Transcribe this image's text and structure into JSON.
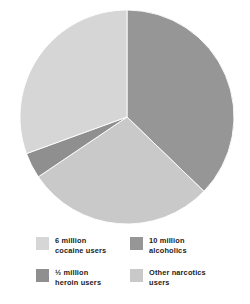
{
  "chart_data": {
    "type": "pie",
    "title": "",
    "subtitle": "",
    "xlabel": "",
    "ylabel": "",
    "grid": false,
    "legend_position": "bottom",
    "units": "millions of users",
    "start_angle_deg": 0,
    "direction": "clockwise",
    "categories": [
      "10 million alcoholics",
      "Other narcotics users",
      "½ million heroin users",
      "6 million cocaine users"
    ],
    "values": [
      10,
      7.6,
      0.5,
      6
    ],
    "angles_deg": [
      134,
      102,
      14,
      110
    ],
    "colors": [
      "#969696",
      "#c9c9c9",
      "#8f8f8f",
      "#d6d6d6"
    ],
    "slices": [
      {
        "label": "10 million alcoholics",
        "value": 10,
        "value_text": "10 million",
        "group_text": "alcoholics",
        "angle_deg": 134,
        "start_deg": 0,
        "end_deg": 134,
        "color": "#969696"
      },
      {
        "label": "Other narcotics users",
        "value": 7.6,
        "value_text": "Other narcotics",
        "group_text": "users",
        "angle_deg": 102,
        "start_deg": 134,
        "end_deg": 236,
        "color": "#c9c9c9"
      },
      {
        "label": "½ million heroin users",
        "value": 0.5,
        "value_text": "½ million",
        "group_text": "heroin users",
        "angle_deg": 14,
        "start_deg": 236,
        "end_deg": 250,
        "color": "#8f8f8f"
      },
      {
        "label": "6 million cocaine users",
        "value": 6,
        "value_text": "6 million",
        "group_text": "cocaine users",
        "angle_deg": 110,
        "start_deg": 250,
        "end_deg": 360,
        "color": "#d6d6d6"
      }
    ]
  },
  "legend": {
    "items": [
      {
        "label": "6 million\ncocaine users",
        "color": "#d6d6d6"
      },
      {
        "label": "10 million\nalcoholics",
        "color": "#969696"
      },
      {
        "label": "½ million\nheroin users",
        "color": "#8f8f8f"
      },
      {
        "label": "Other narcotics\nusers",
        "color": "#c9c9c9"
      }
    ]
  },
  "figure": {
    "background": "#ffffff",
    "center_x": 127,
    "center_y": 117,
    "radius": 107
  }
}
